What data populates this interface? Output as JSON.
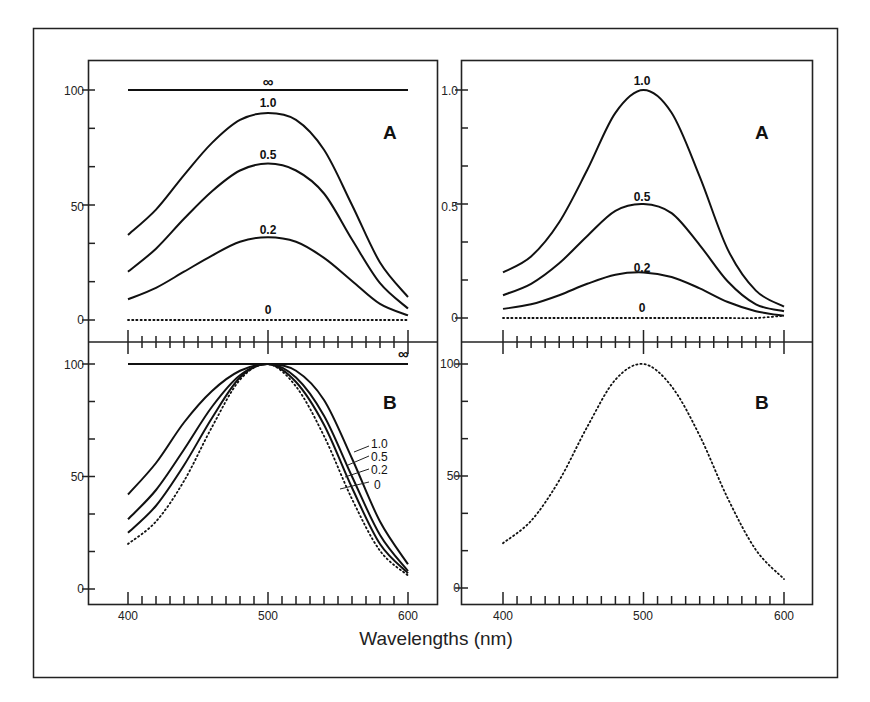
{
  "chart_data": [
    {
      "type": "line",
      "panel": "top-left",
      "letter": "A",
      "x": [
        400,
        420,
        440,
        460,
        480,
        500,
        520,
        540,
        560,
        580,
        600
      ],
      "series": [
        {
          "name": "∞",
          "values": [
            100,
            100,
            100,
            100,
            100,
            100,
            100,
            100,
            100,
            100,
            100
          ],
          "style": "solid"
        },
        {
          "name": "1.0",
          "values": [
            37,
            48,
            63,
            77,
            87,
            90,
            87,
            74,
            50,
            25,
            10
          ],
          "style": "solid"
        },
        {
          "name": "0.5",
          "values": [
            21,
            31,
            44,
            56,
            65,
            68,
            65,
            55,
            35,
            16,
            5
          ],
          "style": "solid"
        },
        {
          "name": "0.2",
          "values": [
            9,
            14,
            21,
            28,
            34,
            36,
            34,
            27,
            17,
            7,
            2
          ],
          "style": "solid"
        },
        {
          "name": "0",
          "values": [
            0,
            0,
            0,
            0,
            0,
            0,
            0,
            0,
            0,
            0,
            0
          ],
          "style": "dotted"
        }
      ],
      "yticks": [
        "0",
        "50",
        "100"
      ],
      "ylim": [
        -10,
        110
      ],
      "xlim": [
        385,
        615
      ]
    },
    {
      "type": "line",
      "panel": "top-right",
      "letter": "A",
      "x": [
        400,
        420,
        440,
        460,
        480,
        500,
        520,
        540,
        560,
        580,
        600
      ],
      "series": [
        {
          "name": "1.0",
          "values": [
            0.2,
            0.27,
            0.42,
            0.65,
            0.9,
            1.0,
            0.9,
            0.62,
            0.3,
            0.12,
            0.05
          ],
          "style": "solid"
        },
        {
          "name": "0.5",
          "values": [
            0.1,
            0.15,
            0.24,
            0.36,
            0.47,
            0.5,
            0.46,
            0.32,
            0.16,
            0.06,
            0.03
          ],
          "style": "solid"
        },
        {
          "name": "0.2",
          "values": [
            0.04,
            0.06,
            0.1,
            0.15,
            0.19,
            0.2,
            0.18,
            0.13,
            0.07,
            0.03,
            0.01
          ],
          "style": "solid"
        },
        {
          "name": "0",
          "values": [
            0,
            0,
            0,
            0,
            0,
            0,
            0,
            0,
            0,
            0,
            0.01
          ],
          "style": "dotted"
        }
      ],
      "yticks": [
        "0",
        "0.5",
        "1.0"
      ],
      "ylim": [
        -0.1,
        1.1
      ],
      "xlim": [
        385,
        615
      ]
    },
    {
      "type": "line",
      "panel": "bottom-left",
      "letter": "B",
      "x": [
        400,
        420,
        440,
        460,
        480,
        500,
        520,
        540,
        560,
        580,
        600
      ],
      "series": [
        {
          "name": "∞",
          "values": [
            100,
            100,
            100,
            100,
            100,
            100,
            100,
            100,
            100,
            100,
            100
          ],
          "style": "solid"
        },
        {
          "name": "1.0",
          "values": [
            42,
            56,
            74,
            88,
            97,
            100,
            97,
            84,
            58,
            30,
            11
          ],
          "style": "solid"
        },
        {
          "name": "0.5",
          "values": [
            31,
            44,
            62,
            81,
            95,
            100,
            94,
            77,
            50,
            24,
            8
          ],
          "style": "solid"
        },
        {
          "name": "0.2",
          "values": [
            25,
            37,
            55,
            76,
            94,
            100,
            92,
            73,
            45,
            20,
            7
          ],
          "style": "solid"
        },
        {
          "name": "0",
          "values": [
            20,
            30,
            48,
            72,
            93,
            100,
            90,
            68,
            40,
            17,
            6
          ],
          "style": "dotted"
        }
      ],
      "yticks": [
        "0",
        "50",
        "100"
      ],
      "xticks": [
        "400",
        "500",
        "600"
      ],
      "ylim": [
        -10,
        110
      ],
      "xlim": [
        385,
        615
      ]
    },
    {
      "type": "line",
      "panel": "bottom-right",
      "letter": "B",
      "x": [
        400,
        420,
        440,
        460,
        480,
        500,
        520,
        540,
        560,
        580,
        600
      ],
      "series": [
        {
          "name": "normalized",
          "values": [
            20,
            30,
            48,
            72,
            93,
            100,
            90,
            68,
            40,
            17,
            4
          ],
          "style": "dotted"
        }
      ],
      "yticks": [
        "0",
        "50",
        "100"
      ],
      "xticks": [
        "400",
        "500",
        "600"
      ],
      "ylim": [
        -10,
        110
      ],
      "xlim": [
        385,
        615
      ]
    }
  ],
  "labels": {
    "xlabel": "Wavelengths (nm)",
    "tl_letter": "A",
    "tr_letter": "A",
    "bl_letter": "B",
    "br_letter": "B",
    "inf": "∞",
    "tl_curves": [
      "1.0",
      "0.5",
      "0.2",
      "0"
    ],
    "tr_curves": [
      "1.0",
      "0.5",
      "0.2",
      "0"
    ],
    "bl_curves": [
      "1.0",
      "0.5",
      "0.2",
      "0"
    ],
    "left_yticks_top": [
      "100",
      "50",
      "0"
    ],
    "right_yticks_top": [
      "1.0",
      "0.5",
      "0"
    ],
    "yticks_bottom": [
      "100",
      "50",
      "0"
    ],
    "xticks": [
      "400",
      "500",
      "600"
    ]
  }
}
